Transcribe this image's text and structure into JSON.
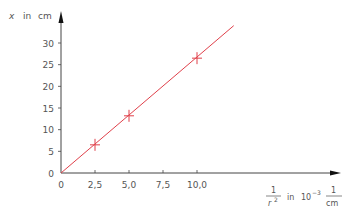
{
  "chart_data": {
    "type": "line",
    "title": "",
    "xlabel": "1/r² in 10⁻³ 1/cm",
    "ylabel": "x in cm",
    "xlabel_parts": {
      "frac_num": "1",
      "frac_den": "r",
      "frac_den_exp": "2",
      "in": "in",
      "power_base": "10",
      "power_exp": "−3",
      "unit_num": "1",
      "unit_den": "cm"
    },
    "ylabel_parts": {
      "var": "x",
      "in": "in",
      "unit": "cm"
    },
    "x_ticks": [
      0,
      2.5,
      5.0,
      7.5,
      10.0
    ],
    "x_tick_labels": [
      "0",
      "2,5",
      "5,0",
      "7,5",
      "10,0"
    ],
    "y_ticks": [
      0,
      5,
      10,
      15,
      20,
      25,
      30
    ],
    "y_tick_labels": [
      "0",
      "5",
      "10",
      "15",
      "20",
      "25",
      "30"
    ],
    "xlim": [
      0,
      20.5
    ],
    "ylim": [
      0,
      37
    ],
    "grid": false,
    "legend": null,
    "series": [
      {
        "name": "measurements",
        "marker": "+",
        "color": "#e0404a",
        "x": [
          2.5,
          5.0,
          10.0
        ],
        "y": [
          6.5,
          13.2,
          26.5
        ]
      },
      {
        "name": "fit line",
        "marker": "none",
        "color": "#e0404a",
        "x": [
          0,
          12.7
        ],
        "y": [
          0,
          34
        ]
      }
    ]
  },
  "colors": {
    "axis": "#444444",
    "tick_text": "#555555",
    "series": "#e0404a"
  }
}
